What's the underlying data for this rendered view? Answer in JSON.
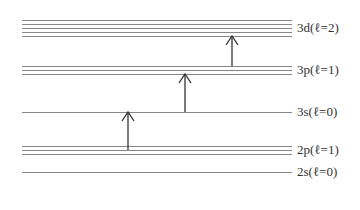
{
  "diagram": {
    "levels": [
      {
        "id": "3d",
        "label": "3d(ℓ=2)",
        "lines_y": [
          20,
          24,
          28,
          32,
          36
        ],
        "label_y": 28
      },
      {
        "id": "3p",
        "label": "3p(ℓ=1)",
        "lines_y": [
          66,
          70,
          74
        ],
        "label_y": 70
      },
      {
        "id": "3s",
        "label": "3s(ℓ=0)",
        "lines_y": [
          112
        ],
        "label_y": 112
      },
      {
        "id": "2p",
        "label": "2p(ℓ=1)",
        "lines_y": [
          146,
          150,
          154
        ],
        "label_y": 150
      },
      {
        "id": "2s",
        "label": "2s(ℓ=0)",
        "lines_y": [
          172
        ],
        "label_y": 172
      }
    ],
    "line_x_start": 22,
    "line_x_end": 292,
    "transitions": [
      {
        "from": "2p",
        "to": "3s",
        "x": 128,
        "y_from": 150,
        "y_to": 112
      },
      {
        "from": "3s",
        "to": "3p",
        "x": 185,
        "y_from": 112,
        "y_to": 74
      },
      {
        "from": "3p",
        "to": "3d",
        "x": 232,
        "y_from": 66,
        "y_to": 36
      }
    ],
    "colors": {
      "line": "#888888",
      "arrow": "#333333",
      "text": "#333333"
    }
  }
}
